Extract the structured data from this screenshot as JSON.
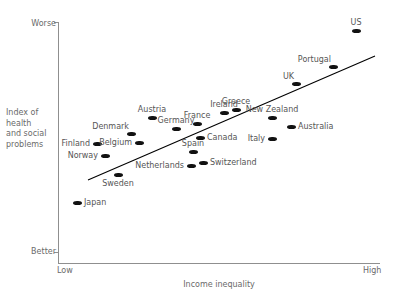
{
  "chart_data": {
    "type": "scatter",
    "title": "",
    "xlabel": "Income inequality",
    "ylabel": "Index of health and social problems",
    "ylabel_lines": [
      "Index of",
      "health",
      "and social",
      "problems"
    ],
    "x_tick_labels": [
      "Low",
      "High"
    ],
    "y_tick_labels": [
      "Worse",
      "Better"
    ],
    "y_tick_top": "Worse",
    "y_tick_bottom": "Better",
    "x_tick_left": "Low",
    "x_tick_right": "High",
    "grid": false,
    "legend": null,
    "axis_color": "#8f8f8f",
    "text_color": "#6a6a6a",
    "marker_color": "#111111",
    "trendline": {
      "present": true,
      "color": "#000000",
      "x1_px": 88,
      "y1_px": 180,
      "x2_px": 375,
      "y2_px": 56,
      "description": "upward sloping best-fit line from lower-left to upper-right"
    },
    "axes_px": {
      "left": 58,
      "right": 380,
      "top": 22,
      "bottom": 263
    },
    "points": [
      {
        "label": "Japan",
        "x_px": 77,
        "y_px": 203,
        "label_pos": "lbl-right"
      },
      {
        "label": "Norway",
        "x_px": 105,
        "y_px": 156,
        "label_pos": "lbl-left"
      },
      {
        "label": "Finland",
        "x_px": 97,
        "y_px": 144,
        "label_pos": "lbl-left"
      },
      {
        "label": "Sweden",
        "x_px": 118,
        "y_px": 175,
        "label_pos": "lbl-below"
      },
      {
        "label": "Belgium",
        "x_px": 139,
        "y_px": 143,
        "label_pos": "lbl-left"
      },
      {
        "label": "Denmark",
        "x_px": 131,
        "y_px": 134,
        "label_pos": "lbl-above-left"
      },
      {
        "label": "Austria",
        "x_px": 152,
        "y_px": 118,
        "label_pos": "lbl-above"
      },
      {
        "label": "Germany",
        "x_px": 176,
        "y_px": 129,
        "label_pos": "lbl-above"
      },
      {
        "label": "Netherlands",
        "x_px": 191,
        "y_px": 166,
        "label_pos": "lbl-left"
      },
      {
        "label": "Spain",
        "x_px": 193,
        "y_px": 152,
        "label_pos": "lbl-above"
      },
      {
        "label": "France",
        "x_px": 197,
        "y_px": 124,
        "label_pos": "lbl-above"
      },
      {
        "label": "Switzerland",
        "x_px": 203,
        "y_px": 163,
        "label_pos": "lbl-right"
      },
      {
        "label": "Canada",
        "x_px": 200,
        "y_px": 138,
        "label_pos": "lbl-right"
      },
      {
        "label": "Ireland",
        "x_px": 224,
        "y_px": 113,
        "label_pos": "lbl-above"
      },
      {
        "label": "Greece",
        "x_px": 236,
        "y_px": 110,
        "label_pos": "lbl-above"
      },
      {
        "label": "New Zealand",
        "x_px": 272,
        "y_px": 118,
        "label_pos": "lbl-above"
      },
      {
        "label": "Italy",
        "x_px": 272,
        "y_px": 139,
        "label_pos": "lbl-left"
      },
      {
        "label": "Australia",
        "x_px": 291,
        "y_px": 127,
        "label_pos": "lbl-right"
      },
      {
        "label": "UK",
        "x_px": 296,
        "y_px": 84,
        "label_pos": "lbl-above-left"
      },
      {
        "label": "Portugal",
        "x_px": 333,
        "y_px": 67,
        "label_pos": "lbl-above-left"
      },
      {
        "label": "US",
        "x_px": 356,
        "y_px": 31,
        "label_pos": "lbl-above"
      }
    ]
  }
}
